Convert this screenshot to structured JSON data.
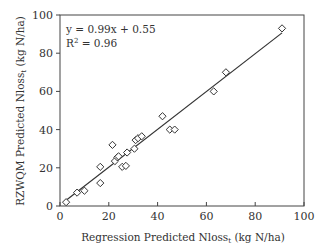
{
  "chart_data": {
    "type": "scatter",
    "title": "",
    "xlabel": "Regression Predicted Nloss",
    "xlabel_sub": "t",
    "xlabel_unit": " (kg N/ha)",
    "ylabel": "RZWQM Predicted Nloss",
    "ylabel_sub": "t",
    "ylabel_unit": " (kg N/ha)",
    "xlim": [
      0,
      100
    ],
    "ylim": [
      0,
      100
    ],
    "xticks": [
      0,
      20,
      40,
      60,
      80,
      100
    ],
    "yticks": [
      0,
      20,
      40,
      60,
      80,
      100
    ],
    "grid": false,
    "legend": null,
    "marker": "open-diamond",
    "annotations": {
      "equation": "y = 0.99x + 0.55",
      "r2_prefix": "R",
      "r2_sup": "2",
      "r2_suffix": " = 0.96"
    },
    "trendline": {
      "slope": 0.99,
      "intercept": 0.55,
      "x_start": 2,
      "x_end": 91
    },
    "series": [
      {
        "name": "Nloss",
        "points": [
          [
            2.5,
            2
          ],
          [
            7,
            7
          ],
          [
            10,
            8
          ],
          [
            16.5,
            12
          ],
          [
            16.5,
            20.5
          ],
          [
            21.5,
            32
          ],
          [
            22.5,
            23.5
          ],
          [
            23.5,
            25.5
          ],
          [
            24,
            26
          ],
          [
            25.5,
            20.5
          ],
          [
            27,
            21
          ],
          [
            27.5,
            28
          ],
          [
            30.5,
            30
          ],
          [
            31,
            34.5
          ],
          [
            32,
            35.5
          ],
          [
            33.5,
            36.5
          ],
          [
            42,
            47
          ],
          [
            45,
            40
          ],
          [
            47,
            40
          ],
          [
            63,
            60
          ],
          [
            68,
            70
          ],
          [
            91,
            93
          ]
        ]
      }
    ],
    "colors": {
      "axis": "#444444",
      "marker": "#333333",
      "line": "#333333"
    }
  }
}
